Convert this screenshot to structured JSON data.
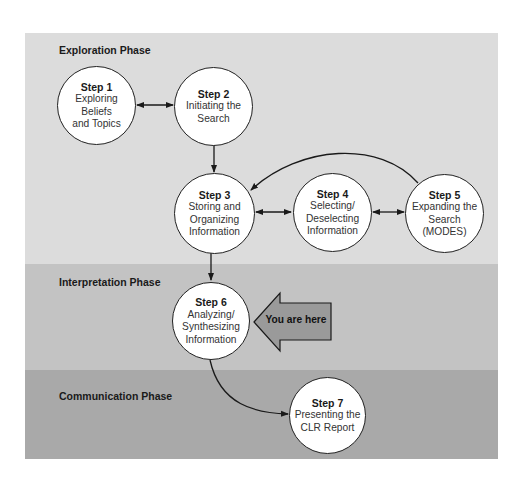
{
  "phases": [
    {
      "id": "exploration",
      "label": "Exploration Phase",
      "color": "#dcdcdc"
    },
    {
      "id": "interpretation",
      "label": "Interpretation Phase",
      "color": "#c3c3c3"
    },
    {
      "id": "communication",
      "label": "Communication Phase",
      "color": "#a9a9a9"
    }
  ],
  "steps": [
    {
      "title": "Step 1",
      "desc": "Exploring\nBeliefs\nand Topics",
      "phase": "exploration"
    },
    {
      "title": "Step 2",
      "desc": "Initiating the\nSearch",
      "phase": "exploration"
    },
    {
      "title": "Step 3",
      "desc": "Storing and\nOrganizing\nInformation",
      "phase": "exploration"
    },
    {
      "title": "Step 4",
      "desc": "Selecting/\nDeselecting\nInformation",
      "phase": "exploration"
    },
    {
      "title": "Step 5",
      "desc": "Expanding the\nSearch\n(MODES)",
      "phase": "exploration"
    },
    {
      "title": "Step 6",
      "desc": "Analyzing/\nSynthesizing\nInformation",
      "phase": "interpretation"
    },
    {
      "title": "Step 7",
      "desc": "Presenting the\nCLR Report",
      "phase": "communication"
    }
  ],
  "connections": [
    {
      "from": "Step 1",
      "to": "Step 2",
      "type": "bidirectional"
    },
    {
      "from": "Step 2",
      "to": "Step 3",
      "type": "directed"
    },
    {
      "from": "Step 3",
      "to": "Step 4",
      "type": "bidirectional"
    },
    {
      "from": "Step 4",
      "to": "Step 5",
      "type": "bidirectional"
    },
    {
      "from": "Step 5",
      "to": "Step 3",
      "type": "directed-curved"
    },
    {
      "from": "Step 3",
      "to": "Step 6",
      "type": "directed"
    },
    {
      "from": "Step 6",
      "to": "Step 7",
      "type": "directed-curved"
    }
  ],
  "marker": {
    "label": "You are here",
    "points_to": "Step 6",
    "color": "#9a9a9a"
  }
}
